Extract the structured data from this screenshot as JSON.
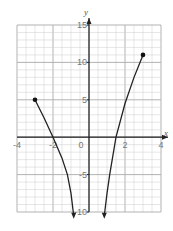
{
  "chart_data": {
    "type": "line",
    "title": "",
    "xlabel": "x",
    "ylabel": "y",
    "xlim": [
      -4,
      4
    ],
    "ylim": [
      -10,
      15
    ],
    "grid": true,
    "x_ticks": [
      "-4",
      "-2",
      "0",
      "2",
      "4"
    ],
    "y_ticks": [
      "15",
      "10",
      "5",
      "-5",
      "-10"
    ],
    "series": [
      {
        "name": "left-branch",
        "x": [
          -3,
          -2.5,
          -2,
          -1.5,
          -1.2,
          -1.0,
          -0.85
        ],
        "y": [
          5,
          2.6,
          0,
          -2.8,
          -5,
          -7.5,
          -10.5
        ],
        "start_marker": "closed-dot",
        "end": "arrow-down"
      },
      {
        "name": "right-branch",
        "x": [
          0.85,
          1.0,
          1.15,
          1.5,
          2.0,
          2.5,
          3
        ],
        "y": [
          -10.5,
          -7.5,
          -5,
          0,
          4.5,
          8,
          11
        ],
        "end_marker": "closed-dot",
        "start": "arrow-down"
      }
    ],
    "points": [
      {
        "x": -3,
        "y": 5
      },
      {
        "x": 3,
        "y": 11
      }
    ]
  },
  "labels": {
    "x_axis": "x",
    "y_axis": "y",
    "origin": "0"
  }
}
